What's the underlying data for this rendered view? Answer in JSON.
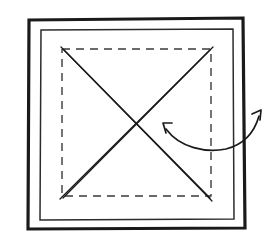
{
  "figure": {
    "canvas": {
      "width": 276,
      "height": 247,
      "background": "#ffffff"
    },
    "colors": {
      "ink_dark": "#1a1a1a",
      "ink_medium": "#2b2b2b",
      "ink_light": "#3a3a3a",
      "background": "#ffffff"
    },
    "outer_frame": {
      "label": "outer square frame",
      "stroke": "#1a1a1a",
      "stroke_width": 3.2,
      "points": "29,20 243,18 245,228 28,229 29,20"
    },
    "inner_frame": {
      "label": "inner square frame",
      "stroke": "#2b2b2b",
      "stroke_width": 1.5,
      "points": "41,30 233,29 234,219 40,220 41,30"
    },
    "dashed_square": {
      "label": "dashed fold-line square",
      "stroke": "#3a3a3a",
      "stroke_width": 1.4,
      "dash_pattern": "8 6",
      "points": "62,49 211,49 211,196 62,196 62,49"
    },
    "diagonals": [
      {
        "name": "diagonal-top-left-to-bottom-right",
        "stroke": "#1a1a1a",
        "stroke_width": 1.3,
        "strokes": [
          "M61,47 L212,201",
          "M64,50 L210,198"
        ]
      },
      {
        "name": "diagonal-bottom-left-to-top-right",
        "stroke": "#1a1a1a",
        "stroke_width": 1.3,
        "strokes": [
          "M60,199 L213,47",
          "M63,198 L210,50"
        ]
      }
    ],
    "crossing_point": {
      "x": 138,
      "y": 127
    },
    "curved_arrow": {
      "label": "double-headed curved rotation arrow",
      "stroke": "#1a1a1a",
      "stroke_width": 1.7,
      "path": "M166,129 C180,148 206,153 226,149 C246,144 255,130 259,116",
      "arrowheads": [
        {
          "name": "arrowhead-left",
          "tip": {
            "x": 163,
            "y": 123
          },
          "barbs": "M172,123 L163,123 L166,133"
        },
        {
          "name": "arrowhead-right",
          "tip": {
            "x": 261,
            "y": 110
          },
          "barbs": "M252,114 L261,110 L260,120"
        }
      ]
    }
  }
}
